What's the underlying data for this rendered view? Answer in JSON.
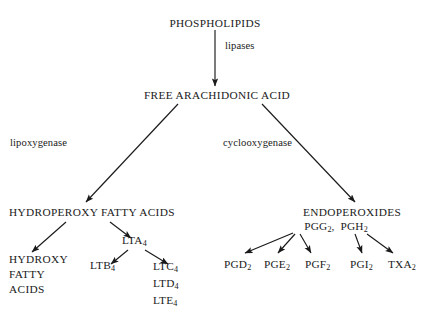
{
  "diagram": {
    "background_color": "#ffffff",
    "line_color": "#1a1a1a",
    "nodes": {
      "phospholipids": "PHOSPHOLIPIDS",
      "lipases": "lipases",
      "free_arachidonic_acid": "FREE ARACHIDONIC ACID",
      "lipoxygenase": "lipoxygenase",
      "cyclooxygenase": "cyclooxygenase",
      "hydroperoxy_fatty_acids": "HYDROPEROXY FATTY ACIDS",
      "endoperoxides": "ENDOPEROXIDES",
      "endoperoxide_species": "PGG2, PGH2",
      "lta4": "LTA4",
      "ltb4": "LTB4",
      "hydroxy_fatty_acids": [
        "HYDROXY",
        "FATTY",
        "ACIDS"
      ],
      "cysteinyl_leukotrienes": [
        "LTC4",
        "LTD4",
        "LTE4"
      ],
      "prostanoids": [
        "PGD2",
        "PGE2",
        "PGF2",
        "PGI2",
        "TXA2"
      ]
    }
  }
}
